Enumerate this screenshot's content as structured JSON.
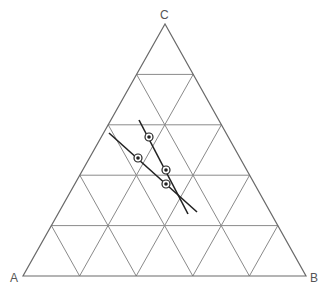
{
  "diagram": {
    "type": "ternary",
    "vertices": {
      "A": {
        "label": "A",
        "x": 23,
        "y": 276
      },
      "B": {
        "label": "B",
        "x": 306,
        "y": 276
      },
      "C": {
        "label": "C",
        "x": 165,
        "y": 24
      }
    },
    "grid_divisions": 5,
    "colors": {
      "grid": "#8a8a8a",
      "line": "#222222",
      "point": "#222222"
    },
    "lines": [
      {
        "from": [
          139,
          120
        ],
        "to": [
          188,
          214
        ]
      },
      {
        "from": [
          109,
          133
        ],
        "to": [
          197,
          212
        ]
      }
    ],
    "points": [
      {
        "x": 149,
        "y": 137
      },
      {
        "x": 138,
        "y": 158
      },
      {
        "x": 166,
        "y": 170
      },
      {
        "x": 166,
        "y": 184
      }
    ]
  }
}
